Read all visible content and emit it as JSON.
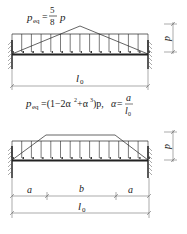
{
  "diagram1": {
    "formula_lhs": "p",
    "formula_sub": "eq",
    "formula_eq": "=",
    "formula_num": "5",
    "formula_den": "8",
    "formula_rhs": "p",
    "load_label": "p",
    "span_label": "l",
    "span_sub": "0"
  },
  "formula2": {
    "lhs": "p",
    "sub": "eq",
    "body": "=(1−2α",
    "sup1": "2",
    "plus": "+α",
    "sup2": "3",
    "tail": ")p,",
    "alpha": "α=",
    "frac_num": "a",
    "frac_den": "l",
    "frac_den_sub": "0"
  },
  "diagram2": {
    "load_label": "p",
    "dim_a_left": "a",
    "dim_b": "b",
    "dim_a_right": "a",
    "span_label": "l",
    "span_sub": "0"
  },
  "colors": {
    "line": "#222222",
    "dim": "#555555"
  }
}
